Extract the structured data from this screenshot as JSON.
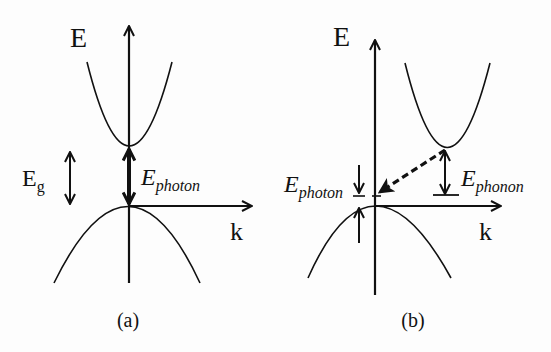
{
  "figure": {
    "stroke_color": "#111111",
    "background": "#fdfdfd"
  },
  "panel_a": {
    "caption": "(a)",
    "y_axis_label": "E",
    "x_axis_label": "k",
    "gap_label_main": "E",
    "gap_label_sub": "g",
    "photon_label_main": "E",
    "photon_label_sub": "photon"
  },
  "panel_b": {
    "caption": "(b)",
    "y_axis_label": "E",
    "x_axis_label": "k",
    "photon_label_main": "E",
    "photon_label_sub": "photon",
    "phonon_label_main": "E",
    "phonon_label_sub": "phonon"
  }
}
